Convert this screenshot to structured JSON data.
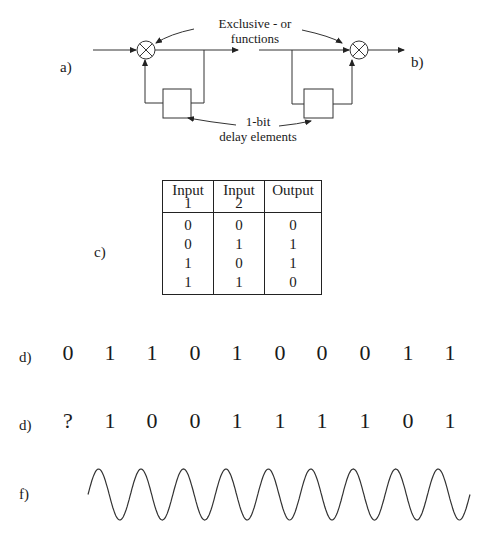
{
  "diagram": {
    "label_a": "a)",
    "label_b": "b)",
    "label_c": "c)",
    "annotation_xor_line1": "Exclusive - or",
    "annotation_xor_line2": "functions",
    "annotation_delay_line1": "1-bit",
    "annotation_delay_line2": "delay elements"
  },
  "truth_table": {
    "headers": [
      {
        "line1": "Input",
        "line2": "1"
      },
      {
        "line1": "Input",
        "line2": "2"
      },
      {
        "line1": "Output",
        "line2": ""
      }
    ],
    "rows": [
      [
        "0",
        "0",
        "0"
      ],
      [
        "0",
        "1",
        "1"
      ],
      [
        "1",
        "0",
        "1"
      ],
      [
        "1",
        "1",
        "0"
      ]
    ]
  },
  "sequences": [
    {
      "label": "d)",
      "bits": [
        "0",
        "1",
        "1",
        "0",
        "1",
        "0",
        "0",
        "0",
        "1",
        "1"
      ]
    },
    {
      "label": "d)",
      "bits": [
        "?",
        "1",
        "0",
        "0",
        "1",
        "1",
        "1",
        "1",
        "0",
        "1"
      ]
    }
  ],
  "waveform": {
    "label": "f)",
    "phase_bits": [
      "1",
      "0",
      "0",
      "1",
      "1",
      "1",
      "1",
      "0",
      "1"
    ]
  }
}
